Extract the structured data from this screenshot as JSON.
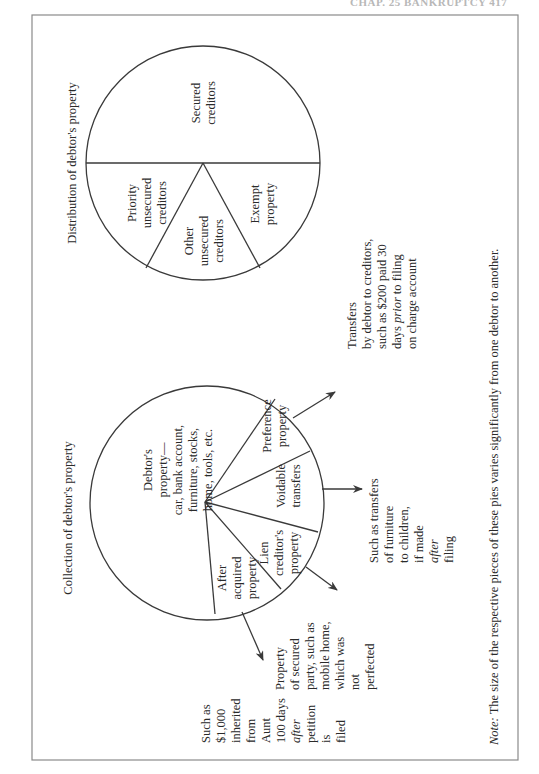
{
  "header": {
    "running_head": "CHAP. 25 BANKRUPTCY 417"
  },
  "distribution": {
    "title": "Distribution of debtor's property",
    "slices": {
      "secured": [
        "Secured",
        "creditors"
      ],
      "priority": [
        "Priority",
        "unsecured",
        "creditors"
      ],
      "other": [
        "Other",
        "unsecured",
        "creditors"
      ],
      "exempt": [
        "Exempt",
        "property"
      ]
    }
  },
  "collection": {
    "title": "Collection of debtor's property",
    "slices": {
      "debtor": [
        "Debtor's",
        "property—",
        "car, bank account,",
        "furniture, stocks,",
        "home, tools, etc."
      ],
      "preference": [
        "Preference",
        "property"
      ],
      "voidable": [
        "Voidable",
        "transfers"
      ],
      "lien": [
        "Lien",
        "creditor's",
        "property"
      ],
      "after": [
        "After",
        "acquired",
        "property"
      ]
    },
    "callouts": {
      "preference": [
        "Transfers",
        "by debtor to creditors,",
        "such as $200 paid 30",
        "days ",
        "prior",
        " to filing",
        "on charge account"
      ],
      "voidable": [
        "Such as transfers",
        "of furniture",
        "to children,",
        "if made",
        "after",
        "filing"
      ],
      "lien": [
        "Property",
        "of secured",
        "party, such as",
        "mobile home,",
        "which was",
        "not",
        "perfected"
      ],
      "after": [
        "Such as",
        "$1,000",
        "inherited",
        "from",
        "Aunt",
        "100 days",
        "after",
        "petition",
        "is",
        "filed"
      ]
    }
  },
  "note": {
    "label": "Note:",
    "text": " The size of the respective pieces of these pies varies significantly from one debtor to another."
  }
}
